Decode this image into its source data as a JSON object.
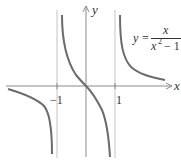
{
  "figure": {
    "function_label": {
      "lhs": "y",
      "eq": "=",
      "numerator": "x",
      "denominator_base": "x",
      "denominator_exp": "2",
      "denominator_rest": " − 1"
    },
    "axis_labels": {
      "x": "x",
      "y": "y"
    },
    "tick_labels": {
      "neg_one": "−1",
      "one": "1"
    },
    "asymptotes": [
      -1,
      1
    ],
    "colors": {
      "curve": "#6b6b6b",
      "axis": "#8a8a8a",
      "asymptote": "#b8b8b8"
    }
  }
}
